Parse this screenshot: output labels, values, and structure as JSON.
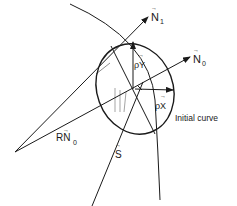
{
  "diagram": {
    "labels": {
      "n1": "N",
      "n1_sub": "1",
      "n0": "N",
      "n0_sub": "0",
      "rn0": "RN",
      "rn0_sub": "0",
      "s": "S",
      "rho_y": "ρY",
      "rho_x": "ρX",
      "initial_curve": "Initial curve"
    },
    "vector_mark": "→",
    "unit_mark": "^",
    "colors": {
      "ink": "#1a1a1a",
      "background": "#ffffff"
    }
  }
}
